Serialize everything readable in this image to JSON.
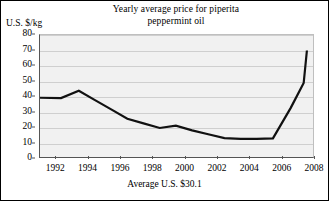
{
  "figure": {
    "y_axis_label": "U.S. $/kg",
    "footnote": "Average U.S. $30.1",
    "title_line1": "Yearly average price for piperita",
    "title_line2": "peppermint oil",
    "colors": {
      "line": "#111111",
      "plot_background": "#f1f1f1",
      "gridline": "#cfcfcf",
      "axis": "#555555",
      "border": "#000000",
      "text": "#000000"
    }
  },
  "chart_data": {
    "type": "line",
    "title": "Yearly average price for piperita peppermint oil",
    "subtitle": "",
    "xlabel": "",
    "ylabel": "U.S. $/kg",
    "annotation": "Average U.S. $30.1",
    "average_value": 30.1,
    "grid": true,
    "grid_axis": "y",
    "legend": false,
    "legend_position": "none",
    "xlim": [
      1991,
      2008
    ],
    "ylim": [
      0,
      80
    ],
    "xticks": [
      1992,
      1994,
      1996,
      1998,
      2000,
      2002,
      2004,
      2006,
      2008
    ],
    "xticklabels": [
      "1992",
      "1994",
      "1996",
      "1998",
      "2000",
      "2002",
      "2004",
      "2006",
      "2008"
    ],
    "yticks": [
      0,
      10,
      20,
      30,
      40,
      50,
      60,
      70,
      80
    ],
    "yticklabels": [
      "0",
      "10",
      "20",
      "30",
      "40",
      "50",
      "60",
      "70",
      "80"
    ],
    "series": [
      {
        "name": "Yearly average price",
        "x": [
          1991.0,
          1992.3,
          1993.4,
          1994.4,
          1995.4,
          1996.4,
          1997.4,
          1998.4,
          1999.4,
          2000.4,
          2001.4,
          2002.4,
          2003.4,
          2004.4,
          2005.4,
          2006.5,
          2007.3,
          2007.5
        ],
        "values": [
          39.5,
          39.3,
          44.0,
          38.0,
          32.0,
          26.0,
          23.0,
          20.0,
          21.5,
          18.5,
          16.0,
          13.5,
          13.0,
          13.0,
          13.3,
          33.0,
          49.0,
          70.0
        ]
      }
    ]
  }
}
